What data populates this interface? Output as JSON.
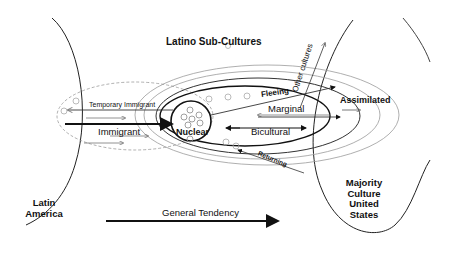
{
  "title": "Latino Sub-Cultures",
  "regions": {
    "left": {
      "line1": "Latin",
      "line2": "America"
    },
    "right": {
      "line1": "Majority",
      "line2": "Culture",
      "line3": "United",
      "line4": "States"
    }
  },
  "labels": {
    "temporary_immigrant": "Temporary Immigrant",
    "immigrant": "Immigrant",
    "nuclear": "Nuclear",
    "fleeing": "Fleeing",
    "marginal": "Marginal",
    "bicultural": "Bicultural",
    "assimilated": "Assimilated",
    "returning": "Returning",
    "other_cultures": "Other cultures",
    "general_tendency": "General Tendency"
  },
  "colors": {
    "stroke": "#111111",
    "light_stroke": "#9a9a9a",
    "background": "#ffffff"
  }
}
